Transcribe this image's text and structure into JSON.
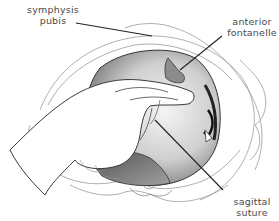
{
  "diagram": {
    "labels": [
      {
        "id": "symphysis-pubis",
        "line1": "symphysis",
        "line2": "pubis"
      },
      {
        "id": "anterior-fontanelle",
        "line1": "anterior",
        "line2": "fontanelle"
      },
      {
        "id": "sagittal-suture",
        "line1": "sagittal",
        "line2": "suture"
      }
    ],
    "colors": {
      "outline": "#3a3a3a",
      "pelvis_line": "#9a9a9a",
      "fontanelle_fill": "#8c8c8c",
      "head_light": "#e6e6e6",
      "head_dark": "#6e6e6e",
      "label_text": "#4a4a4a",
      "leader_line": "#222222"
    }
  }
}
